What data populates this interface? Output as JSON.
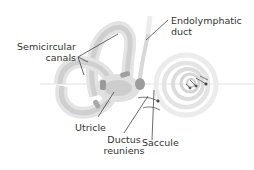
{
  "diagram": {
    "labels": {
      "semicircular_canals_line1": "Semicircular",
      "semicircular_canals_line2": "canals",
      "endolymphatic_duct_line1": "Endolymphatic",
      "endolymphatic_duct_line2": "duct",
      "utricle": "Utricle",
      "ductus_reuniens_line1": "Ductus",
      "ductus_reuniens_line2": "reuniens",
      "saccule": "Saccule"
    },
    "colors": {
      "background": "#ffffff",
      "bony_labyrinth": "#e6e6e6",
      "membranous": "#c8c8c8",
      "dark_structures": "#8c8c8c",
      "leader_lines": "#444444",
      "text": "#333333"
    }
  }
}
